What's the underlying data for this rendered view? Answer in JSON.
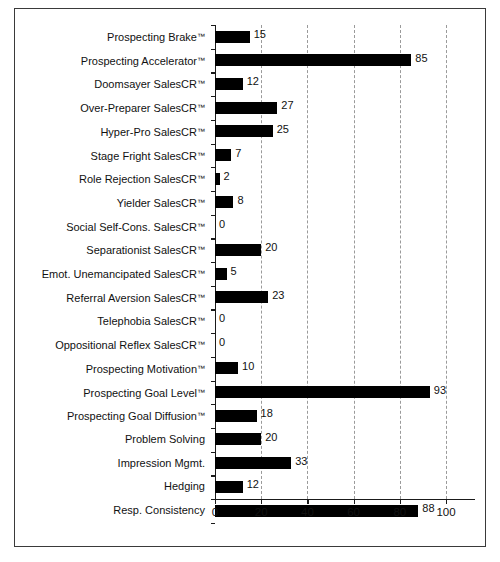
{
  "chart_data": {
    "type": "bar",
    "orientation": "horizontal",
    "title": "",
    "xlabel": "",
    "ylabel": "",
    "xlim": [
      0,
      100
    ],
    "xticks": [
      0,
      20,
      40,
      60,
      80,
      100
    ],
    "grid": true,
    "grid_axis": "x",
    "grid_style": "dashed",
    "legend": false,
    "bar_color": "#000000",
    "categories": [
      "Prospecting Brake™",
      "Prospecting Accelerator™",
      "Doomsayer SalesCR™",
      "Over-Preparer SalesCR™",
      "Hyper-Pro SalesCR™",
      "Stage Fright SalesCR™",
      "Role Rejection SalesCR™",
      "Yielder SalesCR™",
      "Social Self-Cons. SalesCR™",
      "Separationist SalesCR™",
      "Emot. Unemancipated SalesCR™",
      "Referral Aversion SalesCR™",
      "Telephobia SalesCR™",
      "Oppositional Reflex SalesCR™",
      "Prospecting Motivation™",
      "Prospecting Goal Level™",
      "Prospecting Goal Diffusion™",
      "Problem Solving",
      "Impression Mgmt.",
      "Hedging",
      "Resp. Consistency"
    ],
    "values": [
      15,
      85,
      12,
      27,
      25,
      7,
      2,
      8,
      0,
      20,
      5,
      23,
      0,
      0,
      10,
      93,
      18,
      20,
      33,
      12,
      88
    ],
    "data_labels": [
      "15",
      "85",
      "12",
      "27",
      "25",
      "7",
      "2",
      "8",
      "0",
      "20",
      "5",
      "23",
      "0",
      "0",
      "10",
      "93",
      "18",
      "20",
      "33",
      "12",
      "88"
    ]
  }
}
